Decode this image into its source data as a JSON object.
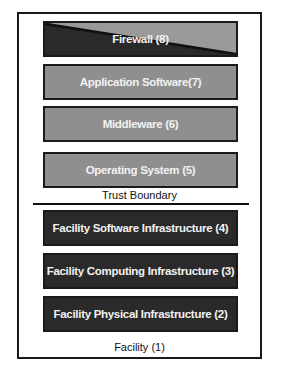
{
  "diagram": {
    "layers": [
      {
        "id": 8,
        "label": "Firewall (8)",
        "style": "split"
      },
      {
        "id": 7,
        "label": "Application Software(7)",
        "style": "light"
      },
      {
        "id": 6,
        "label": "Middleware (6)",
        "style": "light"
      },
      {
        "id": 5,
        "label": "Operating System (5)",
        "style": "light"
      },
      {
        "id": 4,
        "label": "Facility Software Infrastructure (4)",
        "style": "dark"
      },
      {
        "id": 3,
        "label": "Facility Computing Infrastructure (3)",
        "style": "dark"
      },
      {
        "id": 2,
        "label": "Facility Physical Infrastructure (2)",
        "style": "dark"
      }
    ],
    "trust_boundary_label": "Trust Boundary",
    "container_label": "Facility (1)",
    "colors": {
      "light_layer": "#8f8f8f",
      "dark_layer": "#2a2a2a",
      "text": "#f2f2f2",
      "border": "#1a1a1a"
    }
  }
}
